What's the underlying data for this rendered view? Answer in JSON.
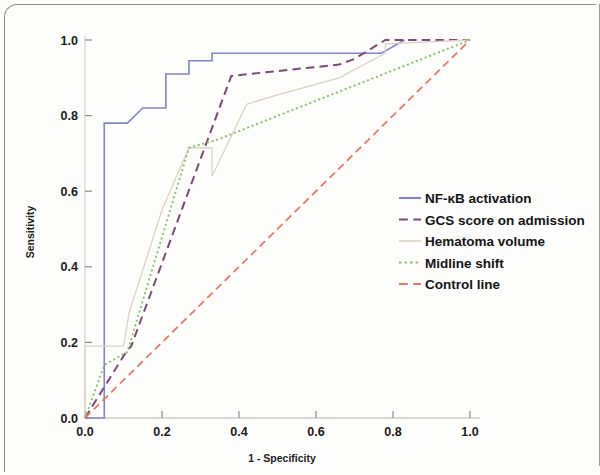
{
  "figure": {
    "background_color": "#fdfdfc",
    "frame_color": "#8d8d8d"
  },
  "chart_data": {
    "type": "line",
    "title": "",
    "subtitle": "",
    "xlabel": "1 - Specificity",
    "ylabel": "Sensitivity",
    "xlim": [
      0.0,
      1.0
    ],
    "ylim": [
      0.0,
      1.0
    ],
    "xticks": [
      "0.0",
      "0.2",
      "0.4",
      "0.6",
      "0.8",
      "1.0"
    ],
    "xtick_values": [
      0.0,
      0.2,
      0.4,
      0.6,
      0.8,
      1.0
    ],
    "yticks": [
      "0.0",
      "0.2",
      "0.4",
      "0.6",
      "0.8",
      "1.0"
    ],
    "ytick_values": [
      0.0,
      0.2,
      0.4,
      0.6,
      0.8,
      1.0
    ],
    "grid": false,
    "legend_position": "center-right",
    "annotations": [],
    "series": [
      {
        "name": "NF-κB activation",
        "color": "#8186c8",
        "dash": "solid",
        "width": 1.6,
        "points": [
          [
            0.0,
            0.0
          ],
          [
            0.05,
            0.0
          ],
          [
            0.05,
            0.78
          ],
          [
            0.11,
            0.78
          ],
          [
            0.15,
            0.82
          ],
          [
            0.21,
            0.82
          ],
          [
            0.21,
            0.91
          ],
          [
            0.27,
            0.91
          ],
          [
            0.27,
            0.945
          ],
          [
            0.33,
            0.945
          ],
          [
            0.33,
            0.965
          ],
          [
            0.77,
            0.965
          ],
          [
            0.83,
            1.0
          ]
        ]
      },
      {
        "name": "GCS score on admission",
        "color": "#7d4a7a",
        "dash": "dashed",
        "width": 2.0,
        "points": [
          [
            0.0,
            0.0
          ],
          [
            0.11,
            0.18
          ],
          [
            0.12,
            0.19
          ],
          [
            0.38,
            0.905
          ],
          [
            0.66,
            0.935
          ],
          [
            0.7,
            0.95
          ],
          [
            0.78,
            1.0
          ],
          [
            1.0,
            1.0
          ]
        ]
      },
      {
        "name": "Hematoma volume",
        "color": "#dcd2c4",
        "dash": "solid",
        "width": 1.3,
        "points": [
          [
            0.0,
            0.0
          ],
          [
            0.0,
            0.19
          ],
          [
            0.055,
            0.19
          ],
          [
            0.1,
            0.19
          ],
          [
            0.115,
            0.28
          ],
          [
            0.2,
            0.55
          ],
          [
            0.27,
            0.715
          ],
          [
            0.33,
            0.715
          ],
          [
            0.33,
            0.64
          ],
          [
            0.42,
            0.83
          ],
          [
            0.5,
            0.855
          ],
          [
            0.66,
            0.9
          ],
          [
            0.78,
            0.965
          ],
          [
            0.78,
            0.99
          ],
          [
            1.0,
            1.0
          ]
        ]
      },
      {
        "name": "Midline shift",
        "color": "#86c167",
        "dash": "dotted",
        "width": 1.8,
        "points": [
          [
            0.0,
            0.0
          ],
          [
            0.05,
            0.14
          ],
          [
            0.11,
            0.175
          ],
          [
            0.27,
            0.715
          ],
          [
            0.34,
            0.735
          ],
          [
            1.0,
            1.0
          ]
        ]
      },
      {
        "name": "Control line",
        "color": "#e8796a",
        "dash": "dashed",
        "width": 1.8,
        "points": [
          [
            0.0,
            0.0
          ],
          [
            1.0,
            1.0
          ]
        ]
      }
    ],
    "legend": [
      {
        "label": "NF-κB activation",
        "color": "#8186c8",
        "dash": "solid"
      },
      {
        "label": "GCS score on admission",
        "color": "#7d4a7a",
        "dash": "dashed"
      },
      {
        "label": "Hematoma volume",
        "color": "#e3dbd0",
        "dash": "solid"
      },
      {
        "label": "Midline shift",
        "color": "#86c167",
        "dash": "dotted"
      },
      {
        "label": "Control line",
        "color": "#e8796a",
        "dash": "dashed"
      }
    ]
  }
}
